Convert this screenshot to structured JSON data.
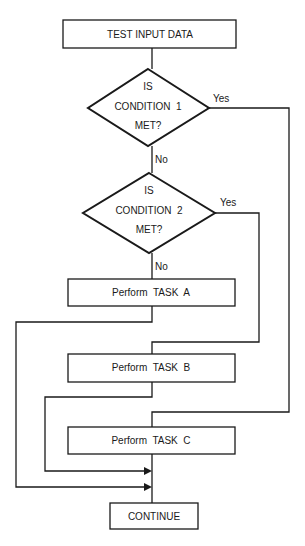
{
  "diagram": {
    "type": "flowchart",
    "colors": {
      "stroke": "#1a1a1a",
      "background": "#ffffff",
      "text": "#1a1a1a"
    },
    "nodes": {
      "start": {
        "label": "TEST INPUT DATA",
        "shape": "rectangle"
      },
      "decision1": {
        "lines": [
          "IS",
          "CONDITION  1",
          "MET?"
        ],
        "shape": "diamond"
      },
      "decision2": {
        "lines": [
          "IS",
          "CONDITION  2",
          "MET?"
        ],
        "shape": "diamond"
      },
      "task_a": {
        "label": "Perform  TASK  A",
        "shape": "rectangle"
      },
      "task_b": {
        "label": "Perform  TASK  B",
        "shape": "rectangle"
      },
      "task_c": {
        "label": "Perform  TASK  C",
        "shape": "rectangle"
      },
      "end": {
        "label": "CONTINUE",
        "shape": "rectangle"
      }
    },
    "edge_labels": {
      "d1_yes": "Yes",
      "d1_no": "No",
      "d2_yes": "Yes",
      "d2_no": "No"
    },
    "edges": [
      {
        "from": "start",
        "to": "decision1"
      },
      {
        "from": "decision1",
        "to": "decision2",
        "label": "No"
      },
      {
        "from": "decision1",
        "to": "task_c",
        "label": "Yes"
      },
      {
        "from": "decision2",
        "to": "task_a",
        "label": "No"
      },
      {
        "from": "decision2",
        "to": "task_b",
        "label": "Yes"
      },
      {
        "from": "task_a",
        "to": "end"
      },
      {
        "from": "task_b",
        "to": "end"
      },
      {
        "from": "task_c",
        "to": "end"
      }
    ]
  }
}
